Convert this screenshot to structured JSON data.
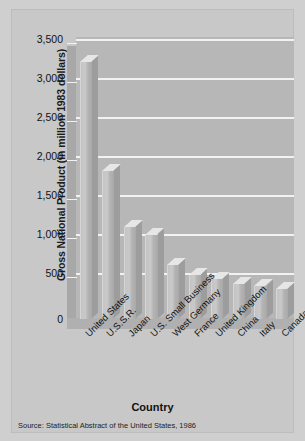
{
  "chart_data": {
    "type": "bar",
    "title": "",
    "subtitle": "",
    "xlabel": "Country",
    "ylabel": "Gross National Product (in million 1983 dollars)",
    "categories": [
      "United States",
      "U.S.S.R.",
      "Japan",
      "U.S. Small Business",
      "West Germany",
      "France",
      "United Kingdom",
      "China",
      "Italy",
      "Canada"
    ],
    "values": [
      3300,
      1900,
      1180,
      1080,
      690,
      560,
      510,
      450,
      420,
      390
    ],
    "ylim": [
      0,
      3500
    ],
    "ytick_values": [
      0,
      500,
      1000,
      1500,
      2000,
      2500,
      3000,
      3500
    ],
    "ytick_labels": [
      "0",
      "500",
      "1,000",
      "1,500",
      "2,000",
      "2,500",
      "3,000",
      "3,500"
    ],
    "grid": true,
    "legend": "none",
    "source_note": "Source:  Statistical Abstract of the United States, 1986",
    "style": "3d-bar-grayscale"
  },
  "colors": {
    "page_background": "#cfcfcf",
    "card_background": "#c8c8c8",
    "plot_wall": "#b7b7b7",
    "gridline": "#f2f2f2",
    "bar_face": "#c4c4c4",
    "bar_top": "#e6e6e6",
    "bar_side": "#9d9d9d",
    "text": "#121212"
  }
}
